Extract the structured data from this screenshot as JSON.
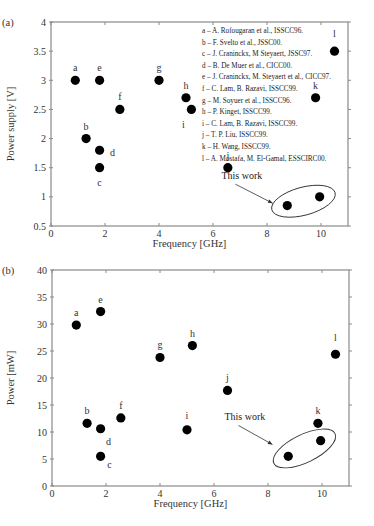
{
  "chart_data": [
    {
      "type": "scatter",
      "panel_label": "(a)",
      "title": "",
      "xlabel": "Frequency [GHz]",
      "ylabel": "Power supply [V]",
      "xlim": [
        0,
        11
      ],
      "ylim": [
        0.5,
        4
      ],
      "xticks": [
        0,
        2,
        4,
        6,
        8,
        10
      ],
      "yticks": [
        0.5,
        1,
        1.5,
        2,
        2.5,
        3,
        3.5,
        4
      ],
      "ytick_labels": [
        "0.5",
        "1",
        "1.5",
        "2",
        "2.5",
        "3",
        "3.5",
        "4"
      ],
      "grid": false,
      "points": [
        {
          "label": "a",
          "x": 0.9,
          "y": 3.0
        },
        {
          "label": "b",
          "x": 1.3,
          "y": 2.0
        },
        {
          "label": "c",
          "x": 1.8,
          "y": 1.5
        },
        {
          "label": "d",
          "x": 1.8,
          "y": 1.8
        },
        {
          "label": "e",
          "x": 1.8,
          "y": 3.0
        },
        {
          "label": "f",
          "x": 2.55,
          "y": 2.5
        },
        {
          "label": "g",
          "x": 4.0,
          "y": 3.0
        },
        {
          "label": "h",
          "x": 5.0,
          "y": 2.7
        },
        {
          "label": "i",
          "x": 5.2,
          "y": 2.5
        },
        {
          "label": "j",
          "x": 6.55,
          "y": 1.5
        },
        {
          "label": "k",
          "x": 9.8,
          "y": 2.7
        },
        {
          "label": "l",
          "x": 10.5,
          "y": 3.5
        }
      ],
      "this_work": [
        {
          "x": 8.75,
          "y": 0.85
        },
        {
          "x": 9.95,
          "y": 1.0
        }
      ],
      "annotation": "This work",
      "legend_position": "upper right",
      "legend": [
        {
          "key": "a",
          "text": "A. Rofougaran et al., ISSCC96."
        },
        {
          "key": "b",
          "text": "F. Svelto et al., JSSC00."
        },
        {
          "key": "c",
          "text": "J. Craninckx, M Steyaert, JSSC97."
        },
        {
          "key": "d",
          "text": "B. De Muer et al., CICC00."
        },
        {
          "key": "e",
          "text": "J. Craninckx, M. Steyaert et al., CICC97."
        },
        {
          "key": "f",
          "text": "C. Lam, B. Razavi, ISSCC99."
        },
        {
          "key": "g",
          "text": "M. Soyuer et al., ISSCC96."
        },
        {
          "key": "h",
          "text": "P. Kinget, ISSCC99."
        },
        {
          "key": "i",
          "text": "C. Lam, B. Razavi, ISSCC99."
        },
        {
          "key": "j",
          "text": "T. P. Liu, ISSCC99."
        },
        {
          "key": "k",
          "text": "H. Wang, ISSCC99."
        },
        {
          "key": "l",
          "text": "A. Mostafa, M. El-Gamal, ESSCIRC00."
        }
      ]
    },
    {
      "type": "scatter",
      "panel_label": "(b)",
      "title": "",
      "xlabel": "Frequency [GHz]",
      "ylabel": "Power [mW]",
      "xlim": [
        0,
        11
      ],
      "ylim": [
        0,
        40
      ],
      "xticks": [
        0,
        2,
        4,
        6,
        8,
        10
      ],
      "yticks": [
        0,
        5,
        10,
        15,
        20,
        25,
        30,
        35,
        40
      ],
      "ytick_labels": [
        "0",
        "5",
        "10",
        "15",
        "20",
        "25",
        "30",
        "35",
        "40"
      ],
      "grid": false,
      "points": [
        {
          "label": "a",
          "x": 0.9,
          "y": 29.8
        },
        {
          "label": "b",
          "x": 1.3,
          "y": 11.6
        },
        {
          "label": "c",
          "x": 1.8,
          "y": 5.5
        },
        {
          "label": "d",
          "x": 1.8,
          "y": 10.6
        },
        {
          "label": "e",
          "x": 1.8,
          "y": 32.3
        },
        {
          "label": "f",
          "x": 2.55,
          "y": 12.6
        },
        {
          "label": "g",
          "x": 4.0,
          "y": 23.8
        },
        {
          "label": "h",
          "x": 5.2,
          "y": 26.0
        },
        {
          "label": "i",
          "x": 5.0,
          "y": 10.4
        },
        {
          "label": "j",
          "x": 6.5,
          "y": 17.7
        },
        {
          "label": "k",
          "x": 9.85,
          "y": 11.6
        },
        {
          "label": "l",
          "x": 10.5,
          "y": 24.4
        }
      ],
      "this_work": [
        {
          "x": 8.75,
          "y": 5.5
        },
        {
          "x": 9.95,
          "y": 8.4
        }
      ],
      "annotation": "This work"
    }
  ]
}
